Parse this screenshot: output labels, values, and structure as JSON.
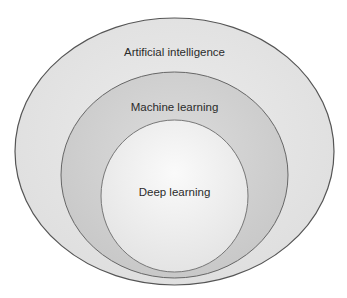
{
  "diagram": {
    "type": "nested-ellipses",
    "layers": [
      {
        "id": "ai",
        "label": "Artificial intelligence",
        "fill": "#e6e6e6",
        "stroke": "#5a5a5a"
      },
      {
        "id": "ml",
        "label": "Machine learning",
        "fill": "#d4d4d4",
        "stroke": "#6a6a6a"
      },
      {
        "id": "dl",
        "label": "Deep learning",
        "fill": "#f1f1f1",
        "stroke": "#7a7a7a"
      }
    ]
  }
}
